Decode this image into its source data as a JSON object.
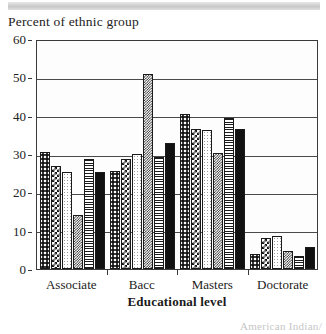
{
  "page": {
    "top_band": "decorative-gray-band",
    "footnote_text": "American Indian/"
  },
  "chart_data": {
    "type": "bar",
    "title": "Percent of ethnic group",
    "xlabel": "Educational level",
    "ylabel": "Percent of ethnic group",
    "categories": [
      "Associate",
      "Bacc",
      "Masters",
      "Doctorate"
    ],
    "ylim": [
      0,
      60
    ],
    "yticks": [
      0,
      10,
      20,
      30,
      40,
      50,
      60
    ],
    "grid": true,
    "legend_position": "below-right",
    "series": [
      {
        "name": "series-1",
        "pattern": "large-dots",
        "values": [
          30.5,
          25.5,
          40.5,
          3.8
        ]
      },
      {
        "name": "series-2",
        "pattern": "checkerboard",
        "values": [
          27.0,
          28.8,
          36.5,
          8.2
        ]
      },
      {
        "name": "series-3",
        "pattern": "light-fine-dots",
        "values": [
          25.3,
          30.0,
          36.3,
          8.6
        ]
      },
      {
        "name": "series-4",
        "pattern": "fine-checkerboard",
        "values": [
          14.2,
          51.0,
          30.3,
          4.8
        ]
      },
      {
        "name": "series-5",
        "pattern": "horizontal-lines",
        "values": [
          28.8,
          29.3,
          39.3,
          3.4
        ]
      },
      {
        "name": "series-6",
        "pattern": "solid-black",
        "values": [
          25.2,
          33.0,
          36.6,
          5.8
        ]
      }
    ]
  }
}
